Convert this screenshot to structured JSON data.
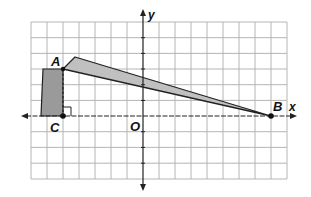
{
  "diagram": {
    "type": "coordinate-grid",
    "grid": {
      "x_min": -7,
      "x_max": 9,
      "y_min": -4,
      "y_max": 6,
      "cell_px_x": 16,
      "cell_px_y": 15.7
    },
    "axes": {
      "x_label": "x",
      "y_label": "y",
      "origin_label": "O"
    },
    "points": [
      {
        "label": "A",
        "x": -5,
        "y": 3
      },
      {
        "label": "B",
        "x": 8,
        "y": 0
      },
      {
        "label": "C",
        "x": -5,
        "y": 0
      }
    ],
    "shapes": [
      {
        "name": "vertical-bar",
        "description": "shaded pole rectangle from C up to A",
        "fill": "#9a9a9a"
      },
      {
        "name": "long-beam",
        "description": "shaded thin quadrilateral from A to B",
        "fill": "#bdbdbd"
      }
    ],
    "annotations": {
      "right_angle_at": "C",
      "dashed_segment": "A-C"
    },
    "colors": {
      "grid": "#b5b5b5",
      "axis": "#222222",
      "bar_fill": "#9a9a9a",
      "beam_fill": "#c0c0c0",
      "outline": "#222222"
    }
  }
}
